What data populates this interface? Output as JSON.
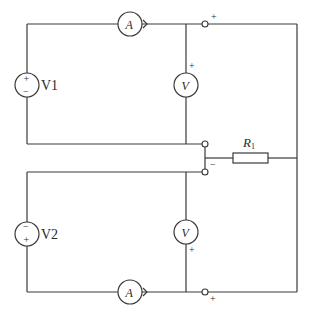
{
  "diagram": {
    "type": "circuit-schematic",
    "components": {
      "source_top": {
        "label": "V1",
        "polarity_top": "+",
        "polarity_bottom": "−"
      },
      "source_bottom": {
        "label": "V2",
        "polarity_top": "−",
        "polarity_bottom": "+"
      },
      "ammeter_top": {
        "label": "A"
      },
      "ammeter_bottom": {
        "label": "A"
      },
      "voltmeter_top": {
        "label": "V",
        "polarity": "+"
      },
      "voltmeter_bottom": {
        "label": "V",
        "polarity": "+"
      },
      "resistor": {
        "label": "R",
        "subscript": "1"
      }
    },
    "terminals": {
      "top_right": "+",
      "middle": "−",
      "bottom_right": "+"
    }
  }
}
